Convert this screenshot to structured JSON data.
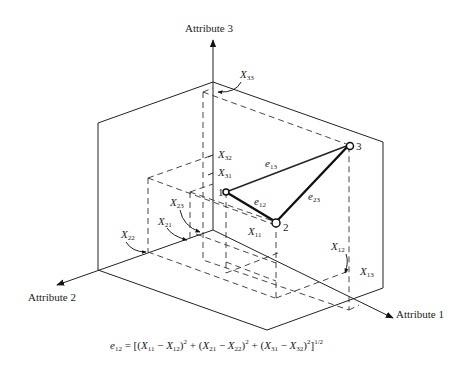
{
  "axes": {
    "attr1": "Attribute 1",
    "attr2": "Attribute 2",
    "attr3": "Attribute 3"
  },
  "points": {
    "p1": "1",
    "p2": "2",
    "p3": "3"
  },
  "edges": {
    "e12": {
      "main": "e",
      "sub": "12"
    },
    "e13": {
      "main": "e",
      "sub": "13"
    },
    "e23": {
      "main": "e",
      "sub": "23"
    }
  },
  "coords": {
    "x11": {
      "main": "X",
      "sub": "11"
    },
    "x12": {
      "main": "X",
      "sub": "12"
    },
    "x13": {
      "main": "X",
      "sub": "13"
    },
    "x21": {
      "main": "X",
      "sub": "21"
    },
    "x22": {
      "main": "X",
      "sub": "22"
    },
    "x23": {
      "main": "X",
      "sub": "23"
    },
    "x31": {
      "main": "X",
      "sub": "31"
    },
    "x32": {
      "main": "X",
      "sub": "32"
    },
    "x33": {
      "main": "X",
      "sub": "33"
    }
  },
  "formula": {
    "lhs": "e",
    "lhs_sub": "12",
    "eq": " = [(",
    "t1a": "X",
    "t1a_sub": "11",
    "m1": " − ",
    "t1b": "X",
    "t1b_sub": "12",
    "c1": ")",
    "plus1": " + (",
    "t2a": "X",
    "t2a_sub": "21",
    "m2": " − ",
    "t2b": "X",
    "t2b_sub": "22",
    "c2": ")",
    "plus2": " + (",
    "t3a": "X",
    "t3a_sub": "31",
    "m3": " − ",
    "t3b": "X",
    "t3b_sub": "32",
    "c3": ")",
    "sq": "2",
    "close": "]",
    "exp": "1/2"
  }
}
